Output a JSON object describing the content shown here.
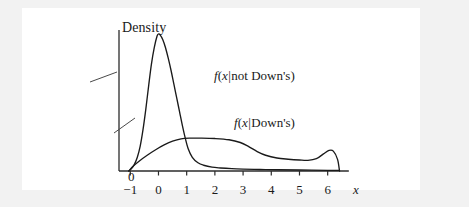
{
  "figure": {
    "background_color": "#f2f2f2",
    "panel_color": "#ffffff",
    "axis_color": "#2b2b2b",
    "curve_color": "#1a1a1a"
  },
  "axes": {
    "y_axis_title": "Density",
    "x_axis_label": "x",
    "origin_label": "0",
    "x_tick_labels": [
      "−1",
      "0",
      "1",
      "2",
      "3",
      "4",
      "5",
      "6"
    ]
  },
  "labels": {
    "not_downs": {
      "f": "f",
      "open": "(",
      "x": "x",
      "bar": "|",
      "text": "not Down's",
      "close": ")"
    },
    "downs": {
      "f": "f",
      "open": "(",
      "x": "x",
      "bar": "|",
      "text": "Down's",
      "close": ")"
    }
  },
  "chart_data": {
    "type": "line",
    "title": "",
    "xlabel": "x",
    "ylabel": "Density",
    "xlim": [
      -1.4,
      6.9
    ],
    "ylim": [
      0,
      1.0
    ],
    "grid": false,
    "legend": "inline-annotations",
    "x_ticks": [
      -1,
      0,
      1,
      2,
      3,
      4,
      5,
      6
    ],
    "y_ticks": [
      0
    ],
    "series": [
      {
        "name": "f(x|not Down's)",
        "annotation": "f(x|not Down's)",
        "x": [
          -1.05,
          -0.95,
          -0.85,
          -0.75,
          -0.65,
          -0.55,
          -0.45,
          -0.35,
          -0.25,
          -0.15,
          -0.05,
          0.0,
          0.05,
          0.15,
          0.25,
          0.35,
          0.45,
          0.55,
          0.65,
          0.75,
          0.85,
          0.95,
          1.05,
          1.2,
          1.4,
          1.6,
          1.9,
          2.2,
          2.6,
          3.0,
          3.6,
          4.2,
          5.0,
          6.0,
          6.4
        ],
        "y": [
          0.0,
          0.02,
          0.05,
          0.1,
          0.18,
          0.3,
          0.45,
          0.62,
          0.78,
          0.9,
          0.985,
          1.0,
          0.995,
          0.96,
          0.9,
          0.82,
          0.73,
          0.63,
          0.53,
          0.43,
          0.33,
          0.24,
          0.165,
          0.1,
          0.06,
          0.042,
          0.028,
          0.022,
          0.017,
          0.014,
          0.011,
          0.009,
          0.007,
          0.005,
          0.004
        ]
      },
      {
        "name": "f(x|Down's)",
        "annotation": "f(x|Down's)",
        "x": [
          -1.05,
          -0.9,
          -0.7,
          -0.4,
          -0.1,
          0.2,
          0.5,
          0.8,
          1.1,
          1.5,
          2.0,
          2.5,
          2.9,
          3.2,
          3.5,
          3.8,
          4.2,
          4.6,
          5.0,
          5.3,
          5.6,
          5.85,
          6.05,
          6.2,
          6.35,
          6.42
        ],
        "y": [
          0.0,
          0.035,
          0.07,
          0.115,
          0.155,
          0.19,
          0.218,
          0.235,
          0.24,
          0.24,
          0.237,
          0.228,
          0.208,
          0.178,
          0.142,
          0.115,
          0.095,
          0.086,
          0.08,
          0.078,
          0.09,
          0.125,
          0.15,
          0.145,
          0.085,
          0.0
        ]
      }
    ]
  }
}
